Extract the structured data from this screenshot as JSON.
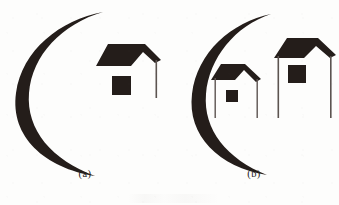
{
  "figure": {
    "title": "",
    "background_color": "#fdfdfc",
    "ink_color": "#241d1a",
    "stroke_color": "#5c5450",
    "width": 339,
    "height": 205,
    "panels": [
      {
        "id": "a",
        "caption": "(a)",
        "description": "single house silhouette beside an open crescent arc",
        "crescent": {
          "opening_direction": "right",
          "max_thickness_px": 10,
          "center_x": 6,
          "center_y": 93,
          "radius_x": 78,
          "radius_y": 88
        },
        "houses": [
          {
            "name": "house-large",
            "roof_color": "#241d1a",
            "window_color": "#241d1a",
            "post_color": "#5c5450",
            "post_count": 1,
            "window": {
              "x": 112,
              "y": 76,
              "w": 19,
              "h": 19
            },
            "roof_peak_x": 145,
            "roof_left_x": 96,
            "roof_right_x": 161
          }
        ]
      },
      {
        "id": "b",
        "caption": "(b)",
        "description": "two house silhouettes of different sizes beside an open crescent arc",
        "crescent": {
          "opening_direction": "right",
          "max_thickness_px": 8,
          "center_x": 10,
          "center_y": 93,
          "radius_x": 72,
          "radius_y": 85
        },
        "houses": [
          {
            "name": "house-small",
            "roof_color": "#241d1a",
            "window_color": "#241d1a",
            "post_color": "#5c5450",
            "post_count": 2,
            "window": {
              "x": 57,
              "y": 90,
              "w": 12,
              "h": 12
            },
            "roof_peak_x": 76,
            "roof_left_x": 42,
            "roof_right_x": 92
          },
          {
            "name": "house-large",
            "roof_color": "#241d1a",
            "window_color": "#241d1a",
            "post_color": "#5c5450",
            "post_count": 2,
            "window": {
              "x": 119,
              "y": 65,
              "w": 18,
              "h": 18
            },
            "roof_peak_x": 149,
            "roof_left_x": 105,
            "roof_right_x": 167
          }
        ]
      }
    ]
  }
}
